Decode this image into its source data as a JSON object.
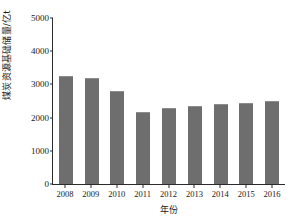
{
  "chart_data": {
    "type": "bar",
    "title": "",
    "xlabel": "年份",
    "ylabel": "煤炭资源基础储量/亿t",
    "categories": [
      "2008",
      "2009",
      "2010",
      "2011",
      "2012",
      "2013",
      "2014",
      "2015",
      "2016"
    ],
    "values": [
      3250,
      3190,
      2790,
      2160,
      2290,
      2360,
      2400,
      2430,
      2490
    ],
    "yticks": [
      0,
      1000,
      2000,
      3000,
      4000,
      5000
    ],
    "ytick_labels": [
      "0",
      "1000",
      "2000",
      "3000",
      "4000",
      "5000"
    ],
    "ylim": [
      0,
      5000
    ],
    "grid": false,
    "legend": null,
    "series": [
      {
        "name": "煤炭资源基础储量",
        "values": [
          3250,
          3190,
          2790,
          2160,
          2290,
          2360,
          2400,
          2430,
          2490
        ]
      }
    ],
    "colors": {
      "bar": "#6e6e6e",
      "bar_top_highlight": "#8d8d8d",
      "axis": "#2b2b2b",
      "background": "#ffffff",
      "text": "#1a1a1a"
    }
  }
}
